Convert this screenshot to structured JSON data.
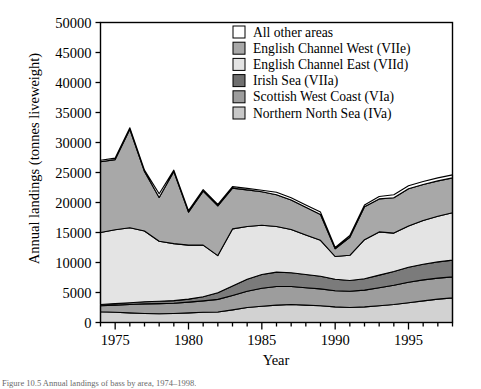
{
  "figure": {
    "caption": "Figure 10.5  Annual landings of bass by area, 1974–1998.",
    "ylabel": "Annual landings (tonnes liveweight)",
    "xlabel": "Year"
  },
  "chart_data": {
    "type": "area",
    "stacked": true,
    "title": "",
    "xlabel": "Year",
    "ylabel": "Annual landings (tonnes liveweight)",
    "xlim": [
      1974,
      1998
    ],
    "ylim": [
      0,
      50000
    ],
    "xticks": [
      1975,
      1980,
      1985,
      1990,
      1995
    ],
    "xtick_labels": [
      "1975",
      "1980",
      "1985",
      "1990",
      "1995"
    ],
    "xminor_step": 1,
    "yticks": [
      0,
      5000,
      10000,
      15000,
      20000,
      25000,
      30000,
      35000,
      40000,
      45000,
      50000
    ],
    "ytick_labels": [
      "0",
      "5000",
      "10000",
      "15000",
      "20000",
      "25000",
      "30000",
      "35000",
      "40000",
      "45000",
      "50000"
    ],
    "grid": false,
    "legend_position": "top-center",
    "x": [
      1974,
      1975,
      1976,
      1977,
      1978,
      1979,
      1980,
      1981,
      1982,
      1983,
      1984,
      1985,
      1986,
      1987,
      1988,
      1989,
      1990,
      1991,
      1992,
      1993,
      1994,
      1995,
      1996,
      1997,
      1998
    ],
    "series": [
      {
        "name": "Northern North Sea (IVa)",
        "color": "#d2d2d2",
        "values": [
          1800,
          1700,
          1600,
          1500,
          1450,
          1500,
          1600,
          1700,
          1750,
          2100,
          2500,
          2700,
          2900,
          3000,
          2900,
          2800,
          2600,
          2500,
          2600,
          2800,
          3000,
          3300,
          3600,
          3900,
          4100
        ]
      },
      {
        "name": "Scottish West Coast (VIa)",
        "color": "#9d9d9d",
        "values": [
          1000,
          1200,
          1400,
          1600,
          1700,
          1700,
          1800,
          1900,
          2100,
          2400,
          2700,
          3000,
          3100,
          3000,
          2900,
          2800,
          2700,
          2700,
          2800,
          3000,
          3200,
          3400,
          3500,
          3500,
          3500
        ]
      },
      {
        "name": "Irish Sea (VIIa)",
        "color": "#7b7b7b",
        "values": [
          200,
          250,
          300,
          350,
          400,
          450,
          500,
          700,
          1100,
          1600,
          2000,
          2300,
          2400,
          2300,
          2200,
          2100,
          1900,
          1800,
          1900,
          2100,
          2300,
          2500,
          2600,
          2700,
          2800
        ]
      },
      {
        "name": "English Channel East (VIId)",
        "color": "#e4e4e4",
        "values": [
          12000,
          12300,
          12500,
          11800,
          10000,
          9500,
          9000,
          8600,
          6200,
          9500,
          8800,
          8200,
          7600,
          7200,
          6600,
          6000,
          3800,
          4200,
          6500,
          7200,
          6400,
          6900,
          7300,
          7600,
          7900
        ]
      },
      {
        "name": "English Channel West (VIIe)",
        "color": "#a8a8a8",
        "values": [
          11800,
          11700,
          16400,
          9900,
          7300,
          12000,
          5500,
          9000,
          8300,
          6800,
          6100,
          5600,
          5300,
          4900,
          4600,
          4300,
          1300,
          3000,
          5500,
          5500,
          5900,
          6200,
          6000,
          5900,
          5800
        ]
      },
      {
        "name": "All other areas",
        "color": "#ffffff",
        "values": [
          250,
          250,
          250,
          250,
          600,
          250,
          250,
          250,
          250,
          250,
          250,
          250,
          400,
          400,
          400,
          400,
          200,
          300,
          300,
          400,
          500,
          500,
          500,
          500,
          500
        ]
      }
    ],
    "legend_entries": [
      {
        "label": "All other areas",
        "color": "#ffffff"
      },
      {
        "label": "English Channel West (VIIe)",
        "color": "#a8a8a8"
      },
      {
        "label": "English Channel East (VIId)",
        "color": "#e4e4e4"
      },
      {
        "label": "Irish Sea (VIIa)",
        "color": "#6f6f6f"
      },
      {
        "label": "Scottish West Coast (VIa)",
        "color": "#9d9d9d"
      },
      {
        "label": "Northern North Sea (IVa)",
        "color": "#c8c8c8"
      }
    ]
  }
}
